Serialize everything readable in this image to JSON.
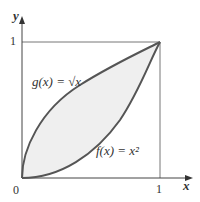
{
  "diagram": {
    "axis_x_label": "x",
    "axis_y_label": "y",
    "origin_label": "0",
    "x_tick_label": "1",
    "y_tick_label": "1",
    "curve_g_label": "g(x) = √x",
    "curve_f_label": "f(x) = x²",
    "colors": {
      "curve": "#555555",
      "fill": "#efefef",
      "axis": "#444444",
      "box": "#777777"
    }
  }
}
